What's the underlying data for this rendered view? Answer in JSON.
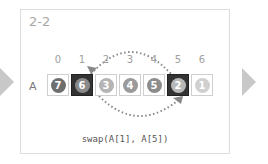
{
  "step_label": "2-2",
  "array_label": "A",
  "indices": [
    "0",
    "1",
    "2",
    "3",
    "4",
    "5",
    "6"
  ],
  "cells": [
    {
      "value": "7",
      "ball_color": "#6e6e6e",
      "highlight": false
    },
    {
      "value": "6",
      "ball_color": "#8a8a8a",
      "highlight": true
    },
    {
      "value": "3",
      "ball_color": "#b4b4b4",
      "highlight": false
    },
    {
      "value": "4",
      "ball_color": "#9a9a9a",
      "highlight": false
    },
    {
      "value": "5",
      "ball_color": "#8c8c8c",
      "highlight": false
    },
    {
      "value": "2",
      "ball_color": "#b8b8b8",
      "highlight": true
    },
    {
      "value": "1",
      "ball_color": "#d0d0d0",
      "highlight": false
    }
  ],
  "caption": "swap(A[1], A[5])",
  "swap": {
    "from": 1,
    "to": 5
  },
  "colors": {
    "arrow": "#c8c8c8",
    "highlight": "#333333",
    "arc": "#888888"
  }
}
